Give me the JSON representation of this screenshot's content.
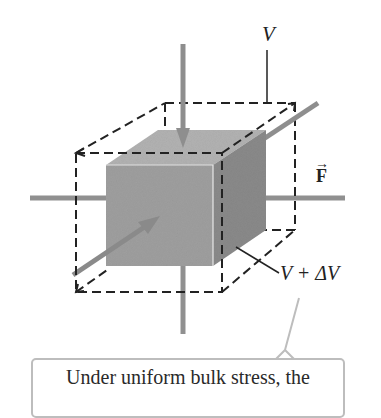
{
  "figure": {
    "type": "bulk-stress-cube-diagram",
    "labels": {
      "initial_volume": "V",
      "force": "F",
      "force_vector_mark": "→",
      "final_volume": "V + ΔV"
    },
    "callout": {
      "text": "Under uniform bulk stress, the"
    },
    "colors": {
      "cube_front": "#9d9d9d",
      "cube_top": "#b4b4b4",
      "cube_right": "#8a8a8a",
      "arrow": "#8e8e8e",
      "dashed_outline": "#222222",
      "callout_border": "#bdbdbd"
    }
  }
}
